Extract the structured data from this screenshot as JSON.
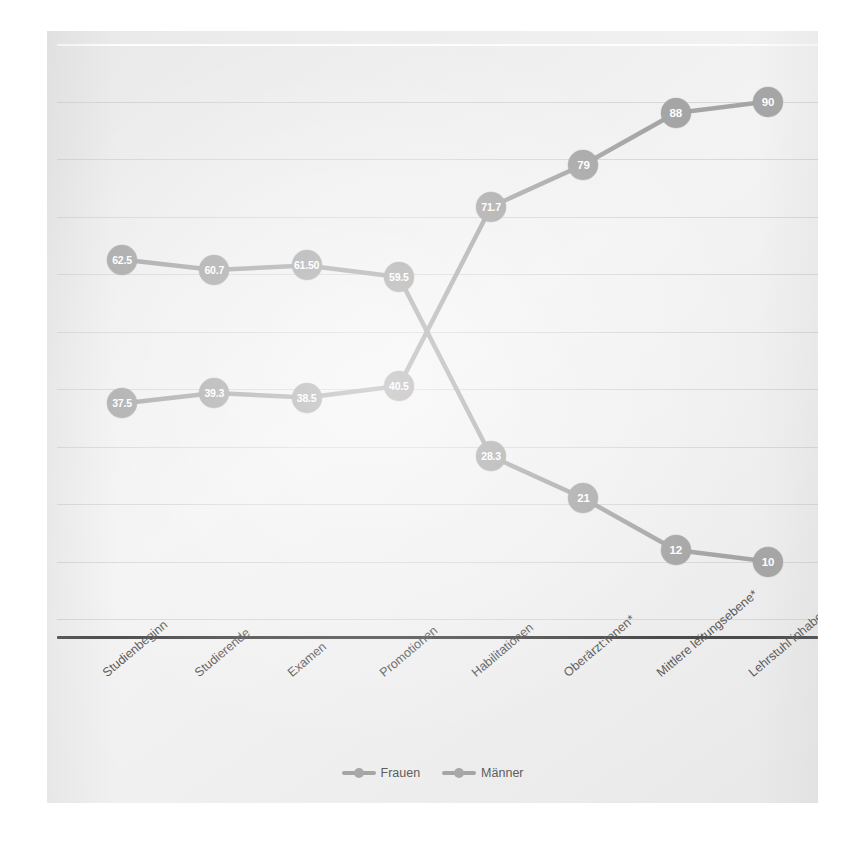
{
  "chart_data": {
    "type": "line",
    "title": "",
    "subtitle": "",
    "xlabel": "",
    "ylabel": "",
    "ylim": [
      0,
      100
    ],
    "ytick_step": 10,
    "grid": true,
    "legend_position": "bottom",
    "categories": [
      "Studienbeginn",
      "Studierende",
      "Examen",
      "Promotionen",
      "Habilitationen",
      "Oberärzt:Innen*",
      "Mittlere leitungsebene*",
      "Lehrstuhl inhabende*"
    ],
    "series": [
      {
        "name": "Frauen",
        "color": "#a5a5a5",
        "values": [
          62.5,
          60.7,
          61.5,
          59.5,
          28.3,
          21,
          12,
          10
        ],
        "labels": [
          "62.5",
          "60.7",
          "61.50",
          "59.5",
          "28.3",
          "21",
          "12",
          "10"
        ]
      },
      {
        "name": "Männer",
        "color": "#a5a5a5",
        "values": [
          37.5,
          39.3,
          38.5,
          40.5,
          71.7,
          79,
          88,
          90
        ],
        "labels": [
          "37.5",
          "39.3",
          "38.5",
          "40.5",
          "71.7",
          "79",
          "88",
          "90"
        ]
      }
    ]
  },
  "legend": {
    "items": [
      {
        "label": "Frauen"
      },
      {
        "label": "Männer"
      }
    ]
  },
  "colors": {
    "panel_background": "#eeeeee",
    "marker": "#a5a5a5",
    "line": "#a5a5a5",
    "gridline": "#d2d2d2",
    "axis": "#4a4a4a",
    "label_text": "#5a5a5a",
    "marker_text": "#ffffff"
  }
}
